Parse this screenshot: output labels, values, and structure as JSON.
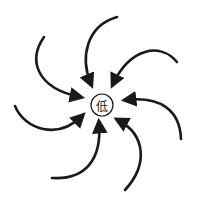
{
  "diagram": {
    "title": "",
    "center": {
      "label": "低",
      "meaning": "low",
      "shape": "circle",
      "cx": 102,
      "cy": 105,
      "r": 11
    },
    "arrows": [
      {
        "id": "arrow-top-left",
        "path": "M44,37 C28,60 36,88 80,97",
        "direction": "inward"
      },
      {
        "id": "arrow-top",
        "path": "M117,17 C86,26 80,58 91,84",
        "direction": "inward"
      },
      {
        "id": "arrow-top-right",
        "path": "M177,62 C160,42 130,48 113,84",
        "direction": "inward"
      },
      {
        "id": "arrow-right",
        "path": "M181,139 C180,110 160,96 126,100",
        "direction": "inward"
      },
      {
        "id": "arrow-bottom-right",
        "path": "M125,190 C148,165 146,135 118,120",
        "direction": "inward"
      },
      {
        "id": "arrow-bottom",
        "path": "M52,178 C85,180 102,160 99,123",
        "direction": "inward"
      },
      {
        "id": "arrow-left",
        "path": "M15,106 C25,130 58,140 82,116",
        "direction": "inward"
      }
    ],
    "colors": {
      "stroke": "#1a1a1a",
      "background": "#ffffff"
    }
  }
}
